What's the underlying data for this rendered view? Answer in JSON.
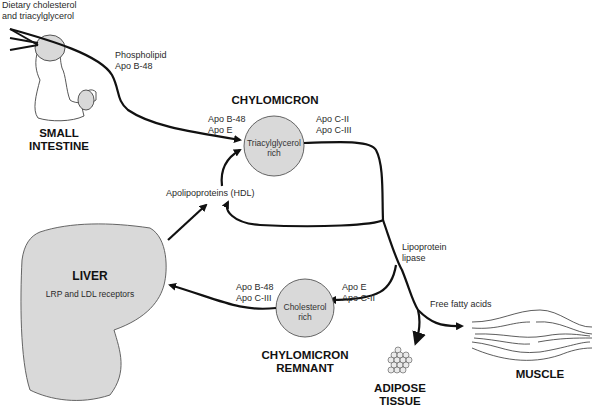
{
  "diagram": {
    "nodes": {
      "small_intestine": {
        "label_line1": "SMALL",
        "label_line2": "INTESTINE"
      },
      "chylomicron": {
        "title": "CHYLOMICRON",
        "inner_line1": "Triacylglycerol",
        "inner_line2": "rich",
        "apo_left_1": "Apo B-48",
        "apo_left_2": "Apo E",
        "apo_right_1": "Apo C-II",
        "apo_right_2": "Apo C-III"
      },
      "liver": {
        "title": "LIVER",
        "subtitle": "LRP and LDL receptors"
      },
      "remnant": {
        "title_line1": "CHYLOMICRON",
        "title_line2": "REMNANT",
        "inner_line1": "Cholesterol",
        "inner_line2": "rich",
        "apo_left_1": "Apo B-48",
        "apo_left_2": "Apo C-III",
        "apo_right_1": "Apo E",
        "apo_right_2": "Apo C-II"
      },
      "adipose": {
        "label_line1": "ADIPOSE",
        "label_line2": "TISSUE"
      },
      "muscle": {
        "label": "MUSCLE"
      }
    },
    "annotations": {
      "dietary_line1": "Dietary cholesterol",
      "dietary_line2": "and triacylglycerol",
      "phospholipid_line1": "Phospholipid",
      "phospholipid_line2": "Apo B-48",
      "hdl": "Apolipoproteins (HDL)",
      "lpl_line1": "Lipoprotein",
      "lpl_line2": "lipase",
      "ffa": "Free fatty acids"
    },
    "colors": {
      "fill": "#d9d9d9",
      "stroke": "#111111"
    }
  }
}
